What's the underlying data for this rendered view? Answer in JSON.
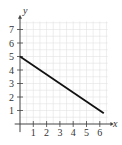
{
  "chart_data": {
    "type": "line",
    "title": "",
    "xlabel": "x",
    "ylabel": "y",
    "xlim": [
      0,
      6.5
    ],
    "ylim": [
      0,
      7.5
    ],
    "x_ticks": [
      "1",
      "2",
      "3",
      "4",
      "5",
      "6"
    ],
    "y_ticks": [
      "1",
      "2",
      "3",
      "4",
      "5",
      "6",
      "7"
    ],
    "grid": true,
    "legend": null,
    "series": [
      {
        "name": "line",
        "x": [
          0,
          6.3
        ],
        "y": [
          5,
          0.8
        ],
        "equation": "y = 5 - (2/3)x",
        "color": "#111111"
      }
    ]
  },
  "colors": {
    "grid": "#e3e3e3",
    "axis": "#444444",
    "line": "#111111"
  }
}
